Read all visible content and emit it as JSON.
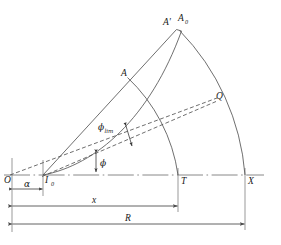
{
  "figure": {
    "type": "geometric-diagram",
    "background_color": "#ffffff",
    "stroke_color": "#4a4a4a",
    "text_color": "#1a1a1a",
    "points": {
      "O": {
        "label": "O",
        "x": 12,
        "y": 175
      },
      "I0": {
        "label": "I",
        "sub": "0",
        "x": 43,
        "y": 175
      },
      "T": {
        "label": "T",
        "x": 178,
        "y": 175
      },
      "X": {
        "label": "X",
        "x": 245,
        "y": 175
      },
      "A": {
        "label": "A",
        "x": 127,
        "y": 78
      },
      "Aprime": {
        "label": "A'",
        "x": 170,
        "y": 22
      },
      "A0": {
        "label": "A",
        "sub": "0",
        "x": 184,
        "y": 18
      },
      "Q": {
        "label": "Q",
        "x": 212,
        "y": 100
      }
    },
    "angles": {
      "phi": {
        "label": "ϕ"
      },
      "phi_lim": {
        "label": "ϕ",
        "sub": "lim"
      }
    },
    "dimensions": {
      "alpha": {
        "label": "α",
        "from": "O",
        "to": "I0"
      },
      "x": {
        "label": "x",
        "from": "O",
        "to": "T"
      },
      "R": {
        "label": "R",
        "from": "O",
        "to": "X"
      }
    },
    "arcs": [
      {
        "name": "inner-arc",
        "from": "T",
        "to": "A",
        "style": "solid"
      },
      {
        "name": "outer-arc",
        "from": "X",
        "to": "A0",
        "style": "solid"
      }
    ],
    "rays": [
      {
        "name": "upper-solid-ray",
        "from": "I0",
        "to": "Aprime",
        "style": "solid"
      },
      {
        "name": "centerline-dashed-ray",
        "from": "O",
        "to": "Q",
        "style": "dashed"
      },
      {
        "name": "lower-dashed-ray",
        "from": "I0",
        "to": "Q",
        "style": "dashed"
      },
      {
        "name": "curved-trajectory",
        "from": "I0",
        "to": "A0",
        "style": "solid-curve"
      }
    ],
    "baseline": {
      "name": "axis-centerline",
      "style": "dash-dot",
      "from_x": 4,
      "to_x": 264,
      "y": 175
    },
    "caption": ""
  }
}
